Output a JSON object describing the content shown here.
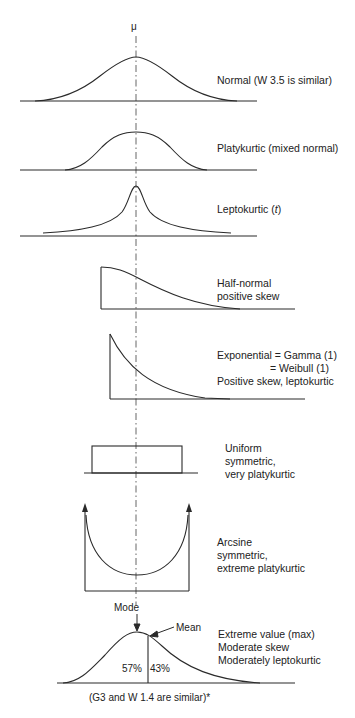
{
  "diagram": {
    "axis_label": "μ",
    "panels": [
      {
        "id": "normal",
        "lines": [
          "Normal (W 3.5 is similar)"
        ]
      },
      {
        "id": "platykurtic",
        "lines": [
          "Platykurtic (mixed normal)"
        ]
      },
      {
        "id": "leptokurtic",
        "lines": [
          "Leptokurtic (",
          "t",
          ")"
        ]
      },
      {
        "id": "half-normal",
        "lines": [
          "Half-normal",
          "positive skew"
        ]
      },
      {
        "id": "exponential",
        "lines": [
          "Exponential = Gamma (1)",
          "= Weibull (1)",
          "Positive skew, leptokurtic"
        ]
      },
      {
        "id": "uniform",
        "lines": [
          "Uniform",
          "symmetric,",
          "very platykurtic"
        ]
      },
      {
        "id": "arcsine",
        "lines": [
          "Arcsine",
          "symmetric,",
          "extreme platykurtic"
        ]
      },
      {
        "id": "extreme-value",
        "lines": [
          "Extreme value (max)",
          "Moderate skew",
          "Moderately leptokurtic"
        ]
      }
    ],
    "extreme_value_annotations": {
      "mode_label": "Mode",
      "mean_label": "Mean",
      "left_pct": "57%",
      "right_pct": "43%",
      "footnote": "(G3 and W 1.4 are similar)*"
    },
    "colors": {
      "line": "#2a2a2a",
      "dash": "#555555",
      "background": "#ffffff"
    }
  }
}
